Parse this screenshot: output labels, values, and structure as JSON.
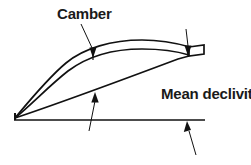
{
  "figure": {
    "type": "line-drawing",
    "background_color": "#ffffff",
    "line_color": "#111111",
    "width": 251,
    "height": 165
  },
  "labels": {
    "camber": "Camber",
    "mean_declivity": "Mean declivity"
  },
  "parts": {
    "upper_surface": "upper-surface-curve",
    "mean_camber_line": "mean-camber-line",
    "lower_surface": "lower-surface-line",
    "chord_line": "chord-baseline",
    "leading_edge": "leading-edge-point",
    "trailing_edge": "trailing-edge-block"
  },
  "annotations": {
    "camber_leader": "camber-leader-arrow",
    "thickness_arrow_right": "right-vertical-arrow",
    "declivity_arrow_mid": "mid-declivity-arrow",
    "declivity_arrow_right": "right-declivity-arrow"
  }
}
